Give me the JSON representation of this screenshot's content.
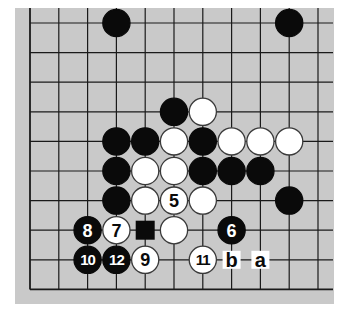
{
  "diagram": {
    "type": "go-board-fragment",
    "board": {
      "background": "#c9c9c9",
      "line_color": "#1a1a1a",
      "origin_x": 30,
      "origin_y": 23,
      "spacing_x": 28.8,
      "spacing_y": 29.6,
      "cols": 11,
      "rows": 10,
      "edges": {
        "left": true,
        "bottom": true,
        "top": false,
        "right": false
      },
      "bg_rect": {
        "x": 15,
        "y": 8,
        "w": 319,
        "h": 296
      }
    },
    "colors": {
      "black": "#0a0a0a",
      "white": "#ffffff",
      "stone_outline": "#3a3a3a"
    },
    "stones": [
      {
        "col": 3,
        "row": 0,
        "color": "black",
        "label": ""
      },
      {
        "col": 9,
        "row": 0,
        "color": "black",
        "label": ""
      },
      {
        "col": 5,
        "row": 3,
        "color": "black",
        "label": ""
      },
      {
        "col": 6,
        "row": 3,
        "color": "white",
        "label": ""
      },
      {
        "col": 3,
        "row": 4,
        "color": "black",
        "label": ""
      },
      {
        "col": 4,
        "row": 4,
        "color": "black",
        "label": ""
      },
      {
        "col": 5,
        "row": 4,
        "color": "white",
        "label": ""
      },
      {
        "col": 6,
        "row": 4,
        "color": "black",
        "label": ""
      },
      {
        "col": 7,
        "row": 4,
        "color": "white",
        "label": ""
      },
      {
        "col": 8,
        "row": 4,
        "color": "white",
        "label": ""
      },
      {
        "col": 9,
        "row": 4,
        "color": "white",
        "label": ""
      },
      {
        "col": 3,
        "row": 5,
        "color": "black",
        "label": ""
      },
      {
        "col": 4,
        "row": 5,
        "color": "white",
        "label": ""
      },
      {
        "col": 5,
        "row": 5,
        "color": "white",
        "label": ""
      },
      {
        "col": 6,
        "row": 5,
        "color": "black",
        "label": ""
      },
      {
        "col": 7,
        "row": 5,
        "color": "black",
        "label": ""
      },
      {
        "col": 8,
        "row": 5,
        "color": "black",
        "label": ""
      },
      {
        "col": 3,
        "row": 6,
        "color": "black",
        "label": ""
      },
      {
        "col": 4,
        "row": 6,
        "color": "white",
        "label": ""
      },
      {
        "col": 5,
        "row": 6,
        "color": "white",
        "label": "5"
      },
      {
        "col": 6,
        "row": 6,
        "color": "white",
        "label": ""
      },
      {
        "col": 9,
        "row": 6,
        "color": "black",
        "label": ""
      },
      {
        "col": 2,
        "row": 7,
        "color": "black",
        "label": "8"
      },
      {
        "col": 3,
        "row": 7,
        "color": "white",
        "label": "7"
      },
      {
        "col": 5,
        "row": 7,
        "color": "white",
        "label": ""
      },
      {
        "col": 7,
        "row": 7,
        "color": "black",
        "label": "6"
      },
      {
        "col": 2,
        "row": 8,
        "color": "black",
        "label": "10"
      },
      {
        "col": 3,
        "row": 8,
        "color": "black",
        "label": "12"
      },
      {
        "col": 4,
        "row": 8,
        "color": "white",
        "label": "9"
      },
      {
        "col": 6,
        "row": 8,
        "color": "white",
        "label": "11"
      }
    ],
    "markers": [
      {
        "col": 4,
        "row": 7,
        "shape": "black-square",
        "label": ""
      }
    ],
    "letters": [
      {
        "col": 7,
        "row": 8,
        "text": "b"
      },
      {
        "col": 8,
        "row": 8,
        "text": "a"
      }
    ]
  }
}
